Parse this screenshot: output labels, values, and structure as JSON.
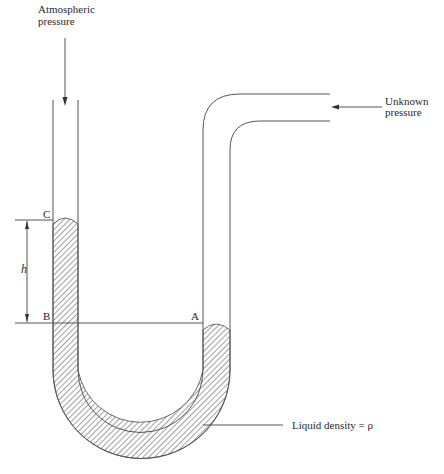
{
  "diagram": {
    "type": "U-tube manometer",
    "labels": {
      "atmospheric_line1": "Atmospheric",
      "atmospheric_line2": "pressure",
      "unknown_line1": "Unknown",
      "unknown_line2": "pressure",
      "point_c": "C",
      "point_b": "B",
      "point_a": "A",
      "height": "h",
      "liquid": "Liquid density = ρ"
    },
    "colors": {
      "line": "#555555",
      "hatch": "#444444",
      "text": "#2a2a2a"
    }
  }
}
